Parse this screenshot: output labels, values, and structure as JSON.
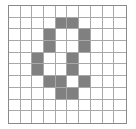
{
  "figure": {
    "name": "shaded-grid-figure",
    "grid": {
      "rows": 10,
      "columns": 10,
      "border_color": "#8a8a8a",
      "gridline_color": "#a8a8a8",
      "empty_cell_color": "#ffffff",
      "filled_cell_color": "#808080",
      "total_cells": 100,
      "filled_cell_count": 17
    }
  },
  "chart_data": {
    "type": "heatmap",
    "title": "",
    "subtitle": "",
    "xlabel": "",
    "ylabel": "",
    "x": [
      0,
      1,
      2,
      3,
      4,
      5,
      6,
      7,
      8,
      9
    ],
    "y": [
      0,
      1,
      2,
      3,
      4,
      5,
      6,
      7,
      8,
      9
    ],
    "xlim": [
      0,
      10
    ],
    "ylim": [
      0,
      10
    ],
    "grid": true,
    "legend": "none",
    "value_labels": {
      "0": "unshaded",
      "1": "shaded"
    },
    "colors": [
      "#ffffff",
      "#808080"
    ],
    "values": [
      [
        0,
        0,
        0,
        0,
        0,
        0,
        0,
        0,
        0,
        0
      ],
      [
        0,
        0,
        0,
        0,
        1,
        1,
        0,
        0,
        0,
        0
      ],
      [
        0,
        0,
        0,
        1,
        0,
        0,
        1,
        0,
        0,
        0
      ],
      [
        0,
        0,
        0,
        1,
        0,
        0,
        1,
        0,
        0,
        0
      ],
      [
        0,
        0,
        1,
        0,
        0,
        1,
        0,
        0,
        0,
        0
      ],
      [
        0,
        0,
        1,
        0,
        0,
        1,
        0,
        0,
        0,
        0
      ],
      [
        0,
        0,
        0,
        1,
        1,
        0,
        1,
        0,
        0,
        0
      ],
      [
        0,
        0,
        0,
        0,
        1,
        1,
        0,
        0,
        0,
        0
      ],
      [
        0,
        0,
        0,
        0,
        0,
        0,
        0,
        0,
        0,
        0
      ],
      [
        0,
        0,
        0,
        0,
        0,
        0,
        0,
        0,
        0,
        0
      ]
    ],
    "filled_cells": [
      [
        1,
        4
      ],
      [
        1,
        5
      ],
      [
        2,
        3
      ],
      [
        2,
        6
      ],
      [
        3,
        3
      ],
      [
        3,
        6
      ],
      [
        4,
        2
      ],
      [
        4,
        5
      ],
      [
        5,
        2
      ],
      [
        5,
        5
      ],
      [
        6,
        3
      ],
      [
        6,
        4
      ],
      [
        6,
        6
      ],
      [
        7,
        4
      ],
      [
        7,
        5
      ]
    ]
  }
}
